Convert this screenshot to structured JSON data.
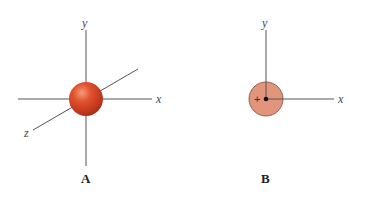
{
  "panels": [
    {
      "caption": "A",
      "axes": {
        "x": "x",
        "y": "y",
        "z": "z"
      },
      "shape": "3D sphere at origin",
      "color": "#d9472a"
    },
    {
      "caption": "B",
      "axes": {
        "x": "x",
        "y": "y"
      },
      "shape": "2D circle at origin with nucleus dot",
      "sign": "+",
      "color": "#e2957a"
    }
  ]
}
